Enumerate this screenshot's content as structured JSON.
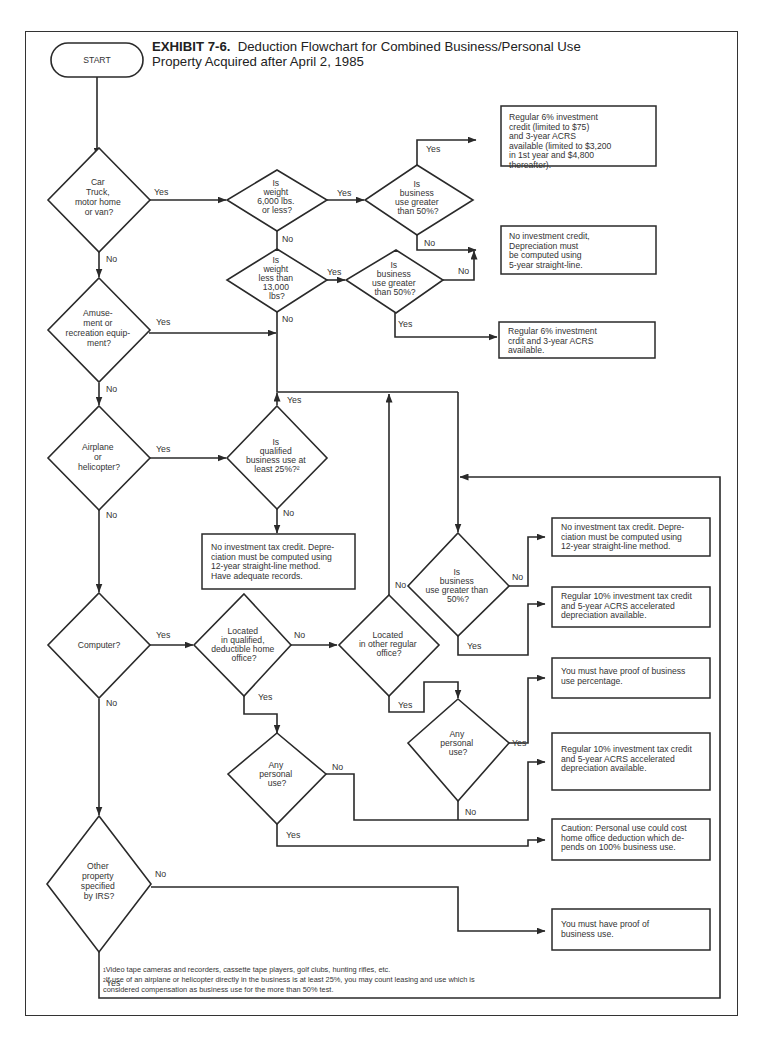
{
  "title": {
    "exhibit": "EXHIBIT 7-6.",
    "line1": "Deduction Flowchart for Combined Business/Personal Use",
    "line2": "Property Acquired after April 2, 1985"
  },
  "start": {
    "label": "START"
  },
  "decisions": {
    "car": [
      "Car",
      "Truck,",
      "motor home",
      "or van?"
    ],
    "amusement": [
      "Amuse-",
      "ment or",
      "recreation equip-",
      "ment?"
    ],
    "airplane": [
      "Airplane",
      "or",
      "helicopter?"
    ],
    "computer": [
      "Computer?"
    ],
    "other_property": [
      "Other",
      "property",
      "specified",
      "by IRS?"
    ],
    "weight_6000": [
      "Is",
      "weight",
      "6,000 lbs.",
      "or less?"
    ],
    "biz_over50_a": [
      "Is",
      "business",
      "use greater",
      "than 50%?"
    ],
    "weight_13000": [
      "Is",
      "weight",
      "less than",
      "13,000",
      "lbs?"
    ],
    "biz_over50_b": [
      "Is",
      "business",
      "use greater",
      "than 50%?"
    ],
    "qualified_25": [
      "Is",
      "qualified",
      "business use at",
      "least 25%?²"
    ],
    "home_office": [
      "Located",
      "in qualified,",
      "deductible home",
      "office?"
    ],
    "other_office": [
      "Located",
      "in other regular",
      "office?"
    ],
    "biz_over50_c": [
      "Is",
      "business",
      "use greater than",
      "50%?"
    ],
    "personal_use_a": [
      "Any",
      "personal",
      "use?"
    ],
    "personal_use_b": [
      "Any",
      "personal",
      "use?"
    ]
  },
  "outcomes": {
    "o1": [
      "Regular 6% investment",
      "credit (limited to $75)",
      "and 3-year ACRS",
      "available (limited to $3,200",
      "in 1st year and $4,800",
      "thereafter)."
    ],
    "o2": [
      "No investment credit,",
      "Depreciation must",
      "be computed using",
      "5-year straight-line."
    ],
    "o3": [
      "Regular 6% investment",
      "crdit and 3-year ACRS",
      "available."
    ],
    "o4": [
      "No investment tax credit. Depre-",
      "ciation must be computed using",
      "12-year straight-line method.",
      "Have adequate records."
    ],
    "o5": [
      "No investment tax credit. Depre-",
      "ciation must be computed using",
      "12-year straight-line method."
    ],
    "o6": [
      "Regular 10% investment tax credit",
      "and 5-year ACRS accelerated",
      "depreciation available."
    ],
    "o7": [
      "You must have proof of business",
      "use percentage."
    ],
    "o8": [
      "Regular 10% investment tax credit",
      "and 5-year ACRS accelerated",
      "depreciation available."
    ],
    "o9": [
      "Caution: Personal use could cost",
      "home office deduction which de-",
      "pends on 100% business use."
    ],
    "o10": [
      "You must have proof of",
      "business use."
    ]
  },
  "labels": {
    "yes": "Yes",
    "no": "No"
  },
  "footnotes": {
    "f1_mark": "1",
    "f1": "Video tape cameras and recorders, cassette tape players, golf clubs, hunting rifles, etc.",
    "f2_mark": "2",
    "f2a": "If use of an airplane or helicopter directly in the business is at least 25%, you may count leasing and use which is",
    "f2b": "considered compensation as business use for the more than 50% test."
  }
}
